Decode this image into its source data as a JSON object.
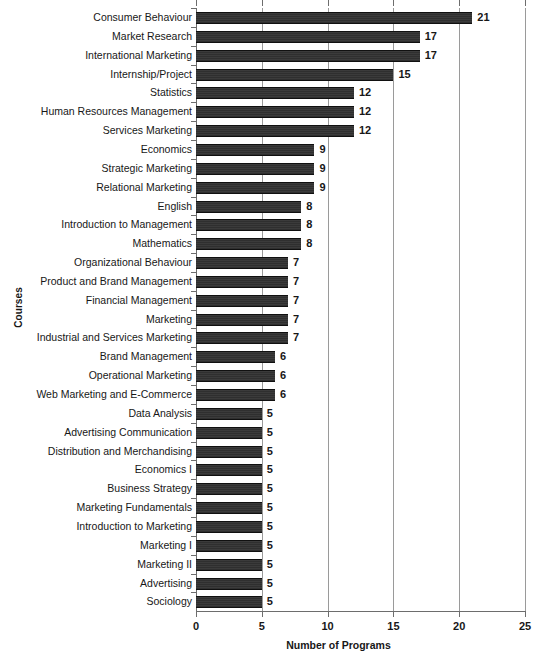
{
  "chart_data": {
    "type": "bar",
    "orientation": "horizontal",
    "title": "",
    "xlabel": "Number of Programs",
    "ylabel": "Courses",
    "xlim": [
      0,
      25
    ],
    "xticks": [
      0,
      5,
      10,
      15,
      20,
      25
    ],
    "grid": true,
    "legend": null,
    "bar_color": "#363636",
    "categories": [
      "Consumer Behaviour",
      "Market Research",
      "International Marketing",
      "Internship/Project",
      "Statistics",
      "Human Resources Management",
      "Services Marketing",
      "Economics",
      "Strategic Marketing",
      "Relational Marketing",
      "English",
      "Introduction to Management",
      "Mathematics",
      "Organizational Behaviour",
      "Product and Brand Management",
      "Financial Management",
      "Marketing",
      "Industrial and Services Marketing",
      "Brand Management",
      "Operational Marketing",
      "Web Marketing and E-Commerce",
      "Data Analysis",
      "Advertising Communication",
      "Distribution and Merchandising",
      "Economics I",
      "Business Strategy",
      "Marketing Fundamentals",
      "Introduction to Marketing",
      "Marketing I",
      "Marketing II",
      "Advertising",
      "Sociology"
    ],
    "values": [
      21,
      17,
      17,
      15,
      12,
      12,
      12,
      9,
      9,
      9,
      8,
      8,
      8,
      7,
      7,
      7,
      7,
      7,
      6,
      6,
      6,
      5,
      5,
      5,
      5,
      5,
      5,
      5,
      5,
      5,
      5,
      5
    ]
  }
}
